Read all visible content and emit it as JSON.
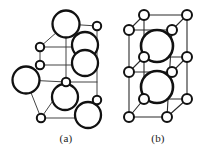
{
  "figure": {
    "background_color": "#ffffff",
    "line_color": "#2b2b2b",
    "atom_fill_color": "#ffffff",
    "atom_stroke_color": "#111111",
    "width": 204,
    "height": 150
  },
  "panels": [
    {
      "id": "a",
      "caption": "(a)",
      "caption_x": 66,
      "caption_y": 142,
      "description": "Unit cell with large anion spheres and small cation spheres",
      "large_atom_radius": 13,
      "small_atom_radius": 4,
      "large_atoms": [
        {
          "cx": 66,
          "cy": 24,
          "r": 13.5
        },
        {
          "cx": 85,
          "cy": 45,
          "r": 13.0
        },
        {
          "cx": 85,
          "cy": 63,
          "r": 13.0
        },
        {
          "cx": 26,
          "cy": 80,
          "r": 13.5
        },
        {
          "cx": 65,
          "cy": 97,
          "r": 13.0
        },
        {
          "cx": 88,
          "cy": 115,
          "r": 13.0
        }
      ],
      "small_atoms": [
        {
          "cx": 40,
          "cy": 47,
          "r": 4.2
        },
        {
          "cx": 40,
          "cy": 65,
          "r": 4.2
        },
        {
          "cx": 97,
          "cy": 26,
          "r": 4.2
        },
        {
          "cx": 66,
          "cy": 82,
          "r": 4.2
        },
        {
          "cx": 97,
          "cy": 100,
          "r": 4.2
        },
        {
          "cx": 41,
          "cy": 118,
          "r": 4.2
        }
      ],
      "edges": [
        {
          "x1": 40,
          "y1": 47,
          "x2": 66,
          "y2": 24
        },
        {
          "x1": 66,
          "y1": 24,
          "x2": 97,
          "y2": 26
        },
        {
          "x1": 40,
          "y1": 47,
          "x2": 97,
          "y2": 47
        },
        {
          "x1": 40,
          "y1": 65,
          "x2": 97,
          "y2": 65
        },
        {
          "x1": 97,
          "y1": 26,
          "x2": 97,
          "y2": 100
        },
        {
          "x1": 40,
          "y1": 47,
          "x2": 40,
          "y2": 65
        },
        {
          "x1": 40,
          "y1": 65,
          "x2": 26,
          "y2": 80
        },
        {
          "x1": 26,
          "y1": 80,
          "x2": 66,
          "y2": 82
        },
        {
          "x1": 26,
          "y1": 80,
          "x2": 41,
          "y2": 118
        },
        {
          "x1": 66,
          "y1": 82,
          "x2": 41,
          "y2": 118
        },
        {
          "x1": 66,
          "y1": 82,
          "x2": 66,
          "y2": 24
        },
        {
          "x1": 41,
          "y1": 118,
          "x2": 97,
          "y2": 118
        },
        {
          "x1": 66,
          "y1": 82,
          "x2": 97,
          "y2": 82
        },
        {
          "x1": 97,
          "y1": 100,
          "x2": 97,
          "y2": 118
        }
      ]
    },
    {
      "id": "b",
      "caption": "(b)",
      "caption_x": 158,
      "caption_y": 142,
      "description": "Tetragonal unit cell with corner and face atoms plus two large central spheres",
      "large_atom_radius": 16,
      "small_atom_radius": 5,
      "large_atoms": [
        {
          "cx": 157,
          "cy": 46,
          "r": 16.0
        },
        {
          "cx": 157,
          "cy": 87,
          "r": 16.0
        }
      ],
      "small_atoms": [
        {
          "cx": 144,
          "cy": 15,
          "r": 5.0
        },
        {
          "cx": 187,
          "cy": 15,
          "r": 5.0
        },
        {
          "cx": 129,
          "cy": 30,
          "r": 5.0
        },
        {
          "cx": 172,
          "cy": 30,
          "r": 5.0
        },
        {
          "cx": 144,
          "cy": 57,
          "r": 5.0
        },
        {
          "cx": 187,
          "cy": 57,
          "r": 5.0
        },
        {
          "cx": 129,
          "cy": 72,
          "r": 5.0
        },
        {
          "cx": 172,
          "cy": 72,
          "r": 5.0
        },
        {
          "cx": 144,
          "cy": 99,
          "r": 5.0
        },
        {
          "cx": 187,
          "cy": 99,
          "r": 5.0
        },
        {
          "cx": 129,
          "cy": 117,
          "r": 5.0
        },
        {
          "cx": 167,
          "cy": 117,
          "r": 5.0
        }
      ],
      "edges": [
        {
          "x1": 144,
          "y1": 15,
          "x2": 187,
          "y2": 15
        },
        {
          "x1": 144,
          "y1": 15,
          "x2": 129,
          "y2": 30
        },
        {
          "x1": 187,
          "y1": 15,
          "x2": 172,
          "y2": 30
        },
        {
          "x1": 129,
          "y1": 30,
          "x2": 172,
          "y2": 30
        },
        {
          "x1": 144,
          "y1": 15,
          "x2": 144,
          "y2": 99
        },
        {
          "x1": 187,
          "y1": 15,
          "x2": 187,
          "y2": 99
        },
        {
          "x1": 129,
          "y1": 30,
          "x2": 129,
          "y2": 117
        },
        {
          "x1": 172,
          "y1": 30,
          "x2": 167,
          "y2": 117
        },
        {
          "x1": 144,
          "y1": 57,
          "x2": 187,
          "y2": 57
        },
        {
          "x1": 129,
          "y1": 72,
          "x2": 172,
          "y2": 72
        },
        {
          "x1": 144,
          "y1": 57,
          "x2": 129,
          "y2": 72
        },
        {
          "x1": 187,
          "y1": 57,
          "x2": 172,
          "y2": 72
        },
        {
          "x1": 144,
          "y1": 99,
          "x2": 187,
          "y2": 99
        },
        {
          "x1": 129,
          "y1": 117,
          "x2": 167,
          "y2": 117
        },
        {
          "x1": 144,
          "y1": 99,
          "x2": 129,
          "y2": 117
        },
        {
          "x1": 187,
          "y1": 99,
          "x2": 167,
          "y2": 117
        }
      ]
    }
  ]
}
